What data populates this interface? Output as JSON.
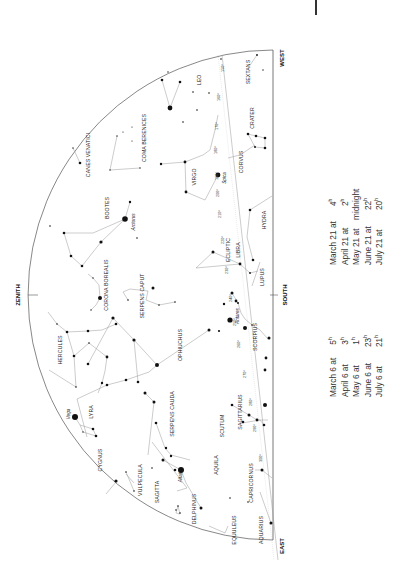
{
  "chart": {
    "directions": {
      "zenith": "ZENITH",
      "west": "WEST",
      "south": "SOUTH",
      "east": "EAST"
    },
    "ecliptic_label": "ECLIPTIC",
    "constellations": [
      "LEO",
      "SEXTANS",
      "COMA BERENICES",
      "CANES VENATICI",
      "VIRGO",
      "CRATER",
      "CORVUS",
      "BOOTES",
      "HYDRA",
      "LIBRA",
      "LUPUS",
      "CORONA BOREALIS",
      "SERPENS CAPUT",
      "OPHIUCHUS",
      "SCORPIUS",
      "HERCULES",
      "LYRA",
      "SERPENS CAUDA",
      "SCUTUM",
      "SAGITTARIUS",
      "CYGNUS",
      "VULPECULA",
      "SAGITTA",
      "AQUILA",
      "DELPHINUS",
      "CAPRICORNUS",
      "EQUULEUS",
      "AQUARIUS"
    ],
    "named_stars": [
      "Arcturus",
      "Spica",
      "Antares",
      "Vega",
      "Altair"
    ],
    "ecliptic_degrees": [
      "150°",
      "160°",
      "170°",
      "180°",
      "190°",
      "200°",
      "210°",
      "220°",
      "230°",
      "240°",
      "250°",
      "260°",
      "270°",
      "280°",
      "290°",
      "300°"
    ]
  },
  "visibility_times": {
    "left_column": [
      {
        "date": "March 6 at",
        "hour": "5",
        "unit": "h"
      },
      {
        "date": "April 6 at",
        "hour": "3",
        "unit": "h"
      },
      {
        "date": "May 6 at",
        "hour": "1",
        "unit": "h"
      },
      {
        "date": "June 6 at",
        "hour": "23",
        "unit": "h"
      },
      {
        "date": "July 6 at",
        "hour": "21",
        "unit": "h"
      }
    ],
    "right_column": [
      {
        "date": "March 21 at",
        "hour": "4",
        "unit": "h"
      },
      {
        "date": "April 21 at",
        "hour": "2",
        "unit": "h"
      },
      {
        "date": "May 21 at",
        "hour": "midnight",
        "unit": ""
      },
      {
        "date": "June 21 at",
        "hour": "22",
        "unit": "h"
      },
      {
        "date": "July 21 at",
        "hour": "20",
        "unit": "h"
      }
    ]
  }
}
